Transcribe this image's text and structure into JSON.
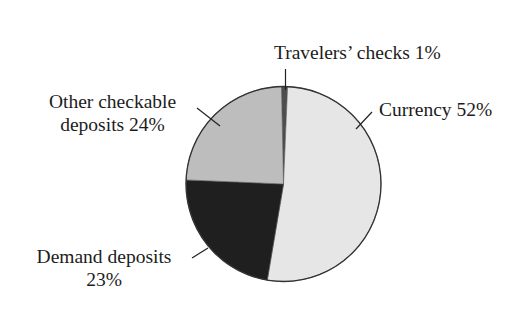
{
  "chart_data": {
    "type": "pie",
    "title": "",
    "start_angle_deg": 0,
    "direction": "clockwise",
    "slices": [
      {
        "label": "Travelers' checks",
        "value": 1,
        "color": "#4d4d4d"
      },
      {
        "label": "Currency",
        "value": 52,
        "color": "#e6e6e6"
      },
      {
        "label": "Demand deposits",
        "value": 23,
        "color": "#1f1f1f"
      },
      {
        "label": "Other checkable deposits",
        "value": 24,
        "color": "#bdbdbd"
      }
    ],
    "legend": "none",
    "data_labels": "outside with leader lines"
  },
  "labels": {
    "travelers": "Travelers’ checks 1%",
    "currency": "Currency 52%",
    "demand_line1": "Demand deposits",
    "demand_line2": "23%",
    "other_line1": "Other checkable",
    "other_line2": "deposits 24%"
  }
}
